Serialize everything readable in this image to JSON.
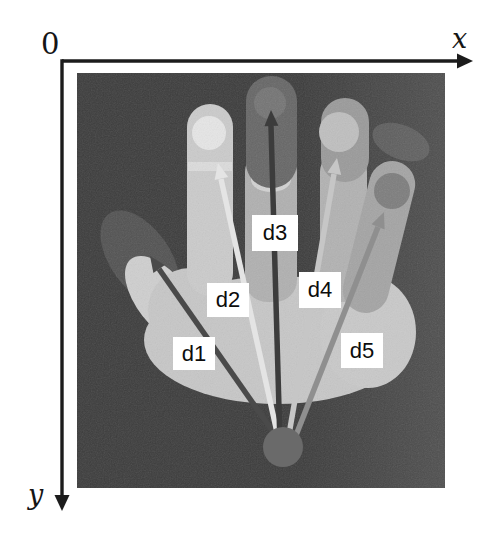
{
  "axes": {
    "origin_label": "0",
    "x_label": "x",
    "y_label": "y"
  },
  "annotations": [
    {
      "label": "d1",
      "target": "thumb-tip",
      "arrow_color": "#4a4a4a"
    },
    {
      "label": "d2",
      "target": "index-fingertip",
      "arrow_color": "#e4e4e4"
    },
    {
      "label": "d3",
      "target": "middle-fingertip",
      "arrow_color": "#3c3c3c"
    },
    {
      "label": "d4",
      "target": "ring-fingertip",
      "arrow_color": "#c6c6c6"
    },
    {
      "label": "d5",
      "target": "little-fingertip",
      "arrow_color": "#8f8f8f"
    }
  ],
  "markers": {
    "origin_color": "#6a6a6a",
    "fingertip_colors": {
      "index": "#e6e6e6",
      "middle": "#747474",
      "ring": "#bfbfbf",
      "little": "#7d7d7d"
    }
  }
}
